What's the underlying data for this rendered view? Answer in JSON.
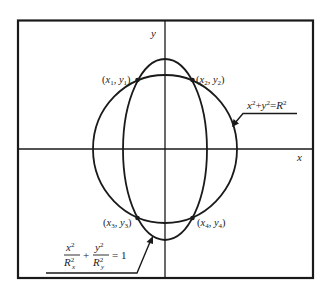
{
  "diagram": {
    "colors": {
      "line": "#1a1a1a",
      "text": "#222222",
      "background": "#ffffff"
    },
    "axes": {
      "x_label": "x",
      "y_label": "y"
    },
    "circle": {
      "equation_lhs_x": "x",
      "equation_lhs_x_exp": "2",
      "equation_plus": "+",
      "equation_lhs_y": "y",
      "equation_lhs_y_exp": "2",
      "equation_eq": "=",
      "equation_rhs": "R",
      "equation_rhs_exp": "2"
    },
    "ellipse": {
      "term1_num": "x",
      "term1_num_exp": "2",
      "term1_den": "R",
      "term1_den_exp": "2",
      "term1_den_sub": "x",
      "plus": "+",
      "term2_num": "y",
      "term2_num_exp": "2",
      "term2_den": "R",
      "term2_den_exp": "2",
      "term2_den_sub": "y",
      "equals": "= 1"
    },
    "points": [
      {
        "label": "(x1, y1)",
        "var_x": "x",
        "sub_x": "1",
        "var_y": "y",
        "sub_y": "1"
      },
      {
        "label": "(x2, y2)",
        "var_x": "x",
        "sub_x": "2",
        "var_y": "y",
        "sub_y": "2"
      },
      {
        "label": "(x3, y3)",
        "var_x": "x",
        "sub_x": "3",
        "var_y": "y",
        "sub_y": "3"
      },
      {
        "label": "(x4, y4)",
        "var_x": "x",
        "sub_x": "4",
        "var_y": "y",
        "sub_y": "4"
      }
    ],
    "punct": {
      "open": "(",
      "comma": ", ",
      "close": ")"
    }
  }
}
